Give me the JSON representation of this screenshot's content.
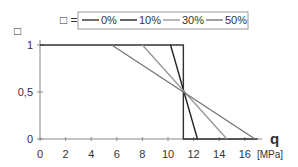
{
  "chart_data": {
    "type": "line",
    "title": "",
    "xlabel": "q",
    "xunit": "[MPa]",
    "ylabel": "□",
    "xlim": [
      0,
      17
    ],
    "ylim": [
      0,
      1
    ],
    "xticks": [
      0,
      2,
      4,
      6,
      8,
      10,
      12,
      14,
      16
    ],
    "yticks": [
      "0",
      "0,5",
      "1"
    ],
    "legend_prefix": "□ =",
    "series": [
      {
        "name": "0%",
        "color": "#333333",
        "points": [
          [
            0,
            1
          ],
          [
            11.2,
            1
          ],
          [
            11.2,
            0
          ],
          [
            17,
            0
          ]
        ]
      },
      {
        "name": "10%",
        "color": "#222222",
        "points": [
          [
            10.2,
            1
          ],
          [
            12.3,
            0
          ]
        ]
      },
      {
        "name": "30%",
        "color": "#999999",
        "points": [
          [
            8.0,
            1
          ],
          [
            14.6,
            0
          ]
        ]
      },
      {
        "name": "50%",
        "color": "#777777",
        "points": [
          [
            5.6,
            1
          ],
          [
            16.8,
            0
          ]
        ]
      }
    ]
  }
}
